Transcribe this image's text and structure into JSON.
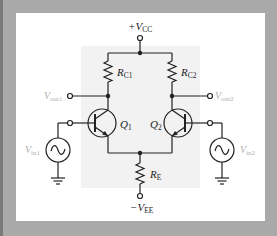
{
  "diagram": {
    "colors": {
      "background": "#a9a9a9",
      "panel": "#ffffff",
      "inner_region": "#f2f2f2",
      "wire": "#222222",
      "faded_label": "#b0b0b0"
    },
    "labels": {
      "vcc": {
        "prefix": "+V",
        "sub": "CC"
      },
      "vee": {
        "prefix": "−V",
        "sub": "EE"
      },
      "rc1": {
        "prefix": "R",
        "sub": "C1"
      },
      "rc2": {
        "prefix": "R",
        "sub": "C2"
      },
      "re": {
        "prefix": "R",
        "sub": "E"
      },
      "q1": {
        "prefix": "Q",
        "sub": "1"
      },
      "q2": {
        "prefix": "Q",
        "sub": "2"
      },
      "vout1": {
        "prefix": "V",
        "sub": "out1"
      },
      "vout2": {
        "prefix": "V",
        "sub": "out2"
      },
      "vin1": {
        "prefix": "V",
        "sub": "in1"
      },
      "vin2": {
        "prefix": "V",
        "sub": "in2"
      }
    },
    "components": [
      {
        "id": "Q1",
        "type": "npn-transistor"
      },
      {
        "id": "Q2",
        "type": "npn-transistor"
      },
      {
        "id": "RC1",
        "type": "resistor"
      },
      {
        "id": "RC2",
        "type": "resistor"
      },
      {
        "id": "RE",
        "type": "resistor"
      },
      {
        "id": "Vin1",
        "type": "ac-source"
      },
      {
        "id": "Vin2",
        "type": "ac-source"
      }
    ]
  }
}
